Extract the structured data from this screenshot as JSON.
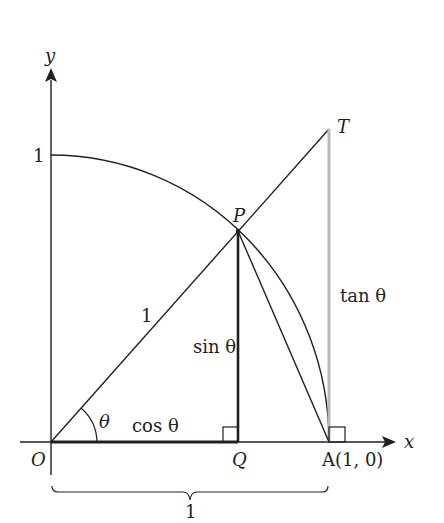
{
  "diagram": {
    "colors": {
      "ink": "#231f20",
      "tangent_segment": "#b8b8b8",
      "background": "#ffffff"
    },
    "axes": {
      "x_label": "x",
      "y_label": "y",
      "y_tick_label": "1"
    },
    "points": {
      "O": {
        "label": "O"
      },
      "P": {
        "label": "P"
      },
      "Q": {
        "label": "Q"
      },
      "A": {
        "label": "A(1, 0)"
      },
      "T": {
        "label": "T"
      }
    },
    "segment_labels": {
      "radius": "1",
      "sin": "sin θ",
      "cos": "cos θ",
      "tan": "tan θ",
      "angle": "θ",
      "brace": "1"
    }
  }
}
